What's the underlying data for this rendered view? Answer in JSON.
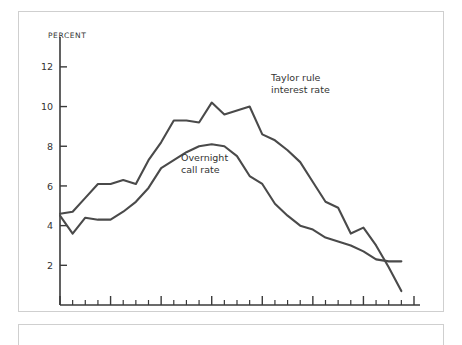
{
  "figure": {
    "unit_label": "PERCENT",
    "background_color": "#ffffff",
    "frame_color": "#cfcfcf",
    "line_color": "#4a4a4a"
  },
  "chart_data": {
    "type": "line",
    "title": "",
    "subtitle": "",
    "xlabel": "",
    "ylabel": "PERCENT",
    "unit_label": "PERCENT",
    "grid": false,
    "legend_position": "inline-annotation",
    "xlim": [
      1988.0,
      1995.0
    ],
    "ylim": [
      0,
      12.8
    ],
    "yticks": [
      2,
      4,
      6,
      8,
      10,
      12
    ],
    "ytick_labels": [
      "2",
      "4",
      "6",
      "8",
      "10",
      "12"
    ],
    "xticks": [
      1988,
      1989,
      1990,
      1991,
      1992,
      1993,
      1994,
      1995
    ],
    "xtick_labels": [
      "1988",
      "1989",
      "1990",
      "1991",
      "1992",
      "1993",
      "1994",
      "1995"
    ],
    "minor_xticks_per_year": 4,
    "x": [
      1988.0,
      1988.25,
      1988.5,
      1988.75,
      1989.0,
      1989.25,
      1989.5,
      1989.75,
      1990.0,
      1990.25,
      1990.5,
      1990.75,
      1991.0,
      1991.25,
      1991.5,
      1991.75,
      1992.0,
      1992.25,
      1992.5,
      1992.75,
      1993.0,
      1993.25,
      1993.5,
      1993.75,
      1994.0,
      1994.25,
      1994.5,
      1994.75
    ],
    "series": [
      {
        "name": "Taylor rule interest rate",
        "color": "#4a4a4a",
        "annotation": "Taylor rule\ninterest rate",
        "annotation_lines": [
          "Taylor rule",
          "interest rate"
        ],
        "values": [
          4.6,
          4.7,
          5.4,
          6.1,
          6.1,
          6.3,
          6.1,
          7.3,
          8.2,
          9.3,
          9.3,
          9.2,
          10.2,
          9.6,
          9.8,
          10.0,
          8.6,
          8.3,
          7.8,
          7.2,
          6.2,
          5.2,
          4.9,
          3.6,
          3.9,
          3.0,
          1.9,
          0.7
        ]
      },
      {
        "name": "Overnight call rate",
        "color": "#4a4a4a",
        "annotation": "Overnight\ncall rate",
        "annotation_lines": [
          "Overnight",
          "call rate"
        ],
        "values": [
          4.5,
          3.6,
          4.4,
          4.3,
          4.3,
          4.7,
          5.2,
          5.9,
          6.9,
          7.3,
          7.7,
          8.0,
          8.1,
          8.0,
          7.5,
          6.5,
          6.1,
          5.1,
          4.5,
          4.0,
          3.8,
          3.4,
          3.2,
          3.0,
          2.7,
          2.3,
          2.2,
          2.2
        ]
      }
    ]
  }
}
